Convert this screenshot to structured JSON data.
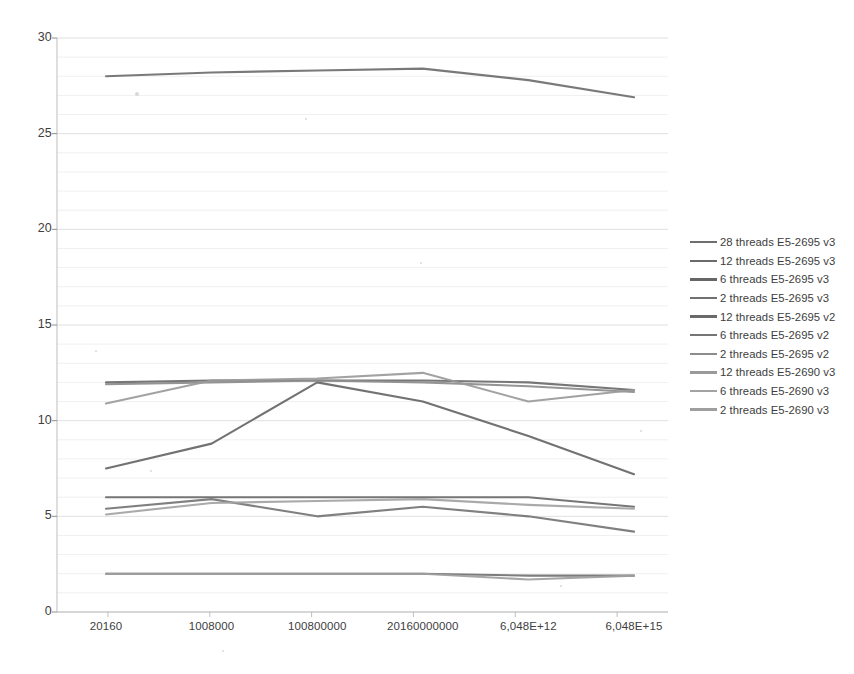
{
  "chart_data": {
    "type": "line",
    "title": "",
    "xlabel": "",
    "ylabel": "",
    "ylim": [
      0,
      30
    ],
    "ytick_step": 5,
    "yminor_step": 1,
    "grid": true,
    "legend_position": "right",
    "categories": [
      "20160",
      "1008000",
      "100800000",
      "20160000000",
      "6,048E+12",
      "6,048E+15"
    ],
    "ytick_labels": [
      "0",
      "5",
      "10",
      "15",
      "20",
      "25",
      "30"
    ],
    "series": [
      {
        "name": "28 threads E5-2695 v3",
        "color": "#6e6e6e",
        "values": [
          28.0,
          28.2,
          28.3,
          28.4,
          27.8,
          26.9
        ]
      },
      {
        "name": "12 threads E5-2695 v3",
        "color": "#6b6b6b",
        "values": [
          12.0,
          12.1,
          12.1,
          12.1,
          12.0,
          11.6
        ]
      },
      {
        "name": "6 threads E5-2695 v3",
        "color": "#666666",
        "values": [
          7.5,
          8.8,
          12.0,
          11.0,
          9.2,
          7.2
        ]
      },
      {
        "name": "2 threads E5-2695 v3",
        "color": "#717171",
        "values": [
          2.0,
          2.0,
          2.0,
          2.0,
          1.9,
          1.9
        ]
      },
      {
        "name": "12 threads E5-2695 v2",
        "color": "#6a6a6a",
        "values": [
          6.0,
          6.0,
          6.0,
          6.0,
          6.0,
          5.5
        ]
      },
      {
        "name": "6 threads E5-2695 v2",
        "color": "#757575",
        "values": [
          5.4,
          5.9,
          5.0,
          5.5,
          5.0,
          4.2
        ]
      },
      {
        "name": "2 threads E5-2695 v2",
        "color": "#8c8c8c",
        "values": [
          11.9,
          12.0,
          12.1,
          12.0,
          11.8,
          11.5
        ]
      },
      {
        "name": "12  threads E5-2690 v3",
        "color": "#9a9a9a",
        "values": [
          10.9,
          12.1,
          12.2,
          12.5,
          11.0,
          11.6
        ]
      },
      {
        "name": "6  threads E5-2690 v3",
        "color": "#a3a3a3",
        "values": [
          5.1,
          5.7,
          5.8,
          5.9,
          5.6,
          5.4
        ]
      },
      {
        "name": "2  threads E5-2690 v3",
        "color": "#9e9e9e",
        "values": [
          2.0,
          2.0,
          2.0,
          2.0,
          1.7,
          1.9
        ]
      }
    ]
  },
  "axis": {
    "plot_left": 57,
    "plot_right": 668,
    "plot_top": 38,
    "plot_bottom": 612
  },
  "colors": {
    "gridline": "#e3e3e3",
    "axis": "#bdbdbd",
    "text": "#404040",
    "background": "#ffffff"
  }
}
